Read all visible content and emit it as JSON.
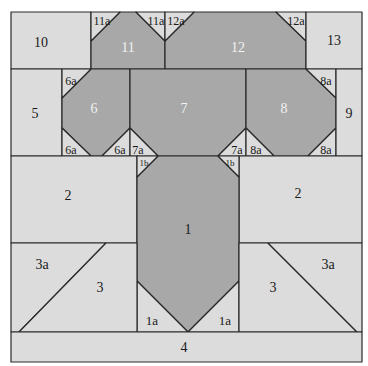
{
  "diagram": {
    "colors": {
      "light": "#dcdcdc",
      "dark": "#a8a8a8",
      "stroke": "#2a2a2a",
      "dark_label": "#f2f2f2",
      "light_label": "#1a1a1a"
    },
    "pieces": [
      {
        "id": "10",
        "label": "10",
        "shade": "light"
      },
      {
        "id": "11",
        "label": "11",
        "shade": "dark"
      },
      {
        "id": "11a_left",
        "label": "11a",
        "shade": "light"
      },
      {
        "id": "11a_right",
        "label": "11a",
        "shade": "light"
      },
      {
        "id": "12",
        "label": "12",
        "shade": "dark"
      },
      {
        "id": "12a_left",
        "label": "12a",
        "shade": "light"
      },
      {
        "id": "12a_right",
        "label": "12a",
        "shade": "light"
      },
      {
        "id": "13",
        "label": "13",
        "shade": "light"
      },
      {
        "id": "5",
        "label": "5",
        "shade": "light"
      },
      {
        "id": "6",
        "label": "6",
        "shade": "dark"
      },
      {
        "id": "6a_top",
        "label": "6a",
        "shade": "light"
      },
      {
        "id": "6a_bottom_left",
        "label": "6a",
        "shade": "light"
      },
      {
        "id": "6a_bottom_right",
        "label": "6a",
        "shade": "light"
      },
      {
        "id": "7",
        "label": "7",
        "shade": "dark"
      },
      {
        "id": "7a_left",
        "label": "7a",
        "shade": "light"
      },
      {
        "id": "7a_right",
        "label": "7a",
        "shade": "light"
      },
      {
        "id": "8",
        "label": "8",
        "shade": "dark"
      },
      {
        "id": "8a_top",
        "label": "8a",
        "shade": "light"
      },
      {
        "id": "8a_bottom_left",
        "label": "8a",
        "shade": "light"
      },
      {
        "id": "8a_bottom_right",
        "label": "8a",
        "shade": "light"
      },
      {
        "id": "9",
        "label": "9",
        "shade": "light"
      },
      {
        "id": "2_left",
        "label": "2",
        "shade": "light"
      },
      {
        "id": "2_right",
        "label": "2",
        "shade": "light"
      },
      {
        "id": "1",
        "label": "1",
        "shade": "dark"
      },
      {
        "id": "1b_left",
        "label": "1b",
        "shade": "light"
      },
      {
        "id": "1b_right",
        "label": "1b",
        "shade": "light"
      },
      {
        "id": "1a_left",
        "label": "1a",
        "shade": "light"
      },
      {
        "id": "1a_right",
        "label": "1a",
        "shade": "light"
      },
      {
        "id": "3_left",
        "label": "3",
        "shade": "light"
      },
      {
        "id": "3a_left",
        "label": "3a",
        "shade": "light"
      },
      {
        "id": "3_right",
        "label": "3",
        "shade": "light"
      },
      {
        "id": "3a_right",
        "label": "3a",
        "shade": "light"
      },
      {
        "id": "4",
        "label": "4",
        "shade": "light"
      }
    ]
  }
}
